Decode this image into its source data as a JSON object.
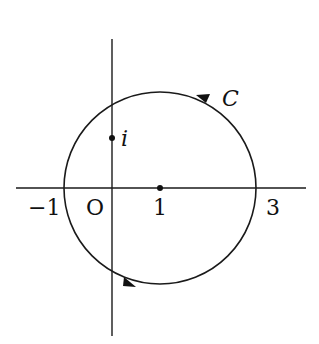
{
  "diagram": {
    "type": "complex-plane-contour",
    "contour": {
      "label": "C",
      "center": [
        1,
        0
      ],
      "radius": 2,
      "orientation": "counterclockwise"
    },
    "points": [
      {
        "name": "center",
        "value": "1"
      },
      {
        "name": "i",
        "label": "i",
        "value": [
          0,
          1
        ]
      }
    ],
    "axis_labels": {
      "neg_one": "−1",
      "origin": "O",
      "one": "1",
      "three": "3"
    },
    "colors": {
      "ink": "#111111",
      "background": "#ffffff"
    }
  }
}
